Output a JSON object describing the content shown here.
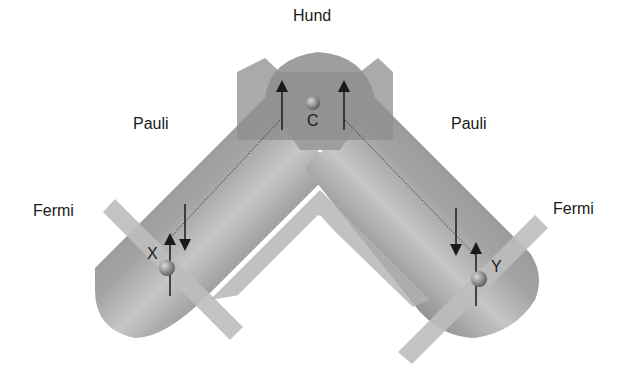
{
  "labels": {
    "hund": "Hund",
    "pauli_left": "Pauli",
    "pauli_right": "Pauli",
    "fermi_left": "Fermi",
    "fermi_right": "Fermi",
    "center_atom": "C",
    "left_atom": "X",
    "right_atom": "Y"
  },
  "colors": {
    "tube_dark": "#8a8a8a",
    "tube_mid": "#a8a8a8",
    "tube_light": "#c4c4c4",
    "band": "#b9b9b9",
    "hund_box": "#9a9a9a",
    "arrow": "#1a1a1a",
    "atom": "#7a7a7a"
  }
}
